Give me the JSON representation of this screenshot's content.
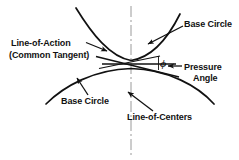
{
  "figure": {
    "background_color": "#ffffff",
    "ink_color": "#111111",
    "centerline_color": "#9a9a9a",
    "width": 239,
    "height": 160
  },
  "labels": {
    "line_of_action": "Line-of-Action",
    "common_tangent": "(Common Tangent)",
    "base_circle_upper": "Base Circle",
    "base_circle_lower": "Base Circle",
    "line_of_centers": "Line-of-Centers",
    "pressure": "Pressure",
    "angle": "Angle",
    "phi_symbol": "ϕ"
  },
  "geometry": {
    "pitch_point": {
      "x": 131,
      "y": 64
    },
    "line_of_centers": {
      "type": "dash-dot-vertical",
      "x": 131,
      "y_top": 6,
      "y_bottom": 155
    },
    "horizontal_reference": {
      "x_start": 102,
      "x_end": 175,
      "y": 64
    },
    "line_of_action": {
      "x_start": 96,
      "y_start": 56,
      "x_end": 178,
      "y_end": 76,
      "description": "common tangent to both base circles, inclined by the pressure angle"
    },
    "upper_base_circle_arc": {
      "description": "concave-up arc tangent to line-of-action, above pitch point",
      "x_start": 76,
      "y_start": 8,
      "x_end": 180,
      "y_end": 14,
      "apex_x": 131,
      "apex_y": 61
    },
    "lower_base_circle_arc": {
      "description": "concave-down arc tangent to line-of-action, below pitch point",
      "x_start": 46,
      "y_start": 104,
      "x_end": 214,
      "y_end": 104,
      "apex_x": 131,
      "apex_y": 68
    },
    "pressure_angle_value_marked": true
  },
  "leaders": [
    {
      "name": "leader-line-of-action",
      "from": {
        "x": 86,
        "y": 43
      },
      "to": {
        "x": 108,
        "y": 51
      },
      "arrowhead": "end"
    },
    {
      "name": "leader-base-circle-upper",
      "from": {
        "x": 182,
        "y": 26
      },
      "to": {
        "x": 147,
        "y": 44
      },
      "arrowhead": "end"
    },
    {
      "name": "leader-base-circle-lower",
      "from": {
        "x": 87,
        "y": 94
      },
      "to": {
        "x": 77,
        "y": 78
      },
      "arrowhead": "end"
    },
    {
      "name": "leader-line-of-centers",
      "from": {
        "x": 152,
        "y": 110
      },
      "to": {
        "x": 128,
        "y": 92
      },
      "arrowhead": "end"
    },
    {
      "name": "leader-pressure-angle",
      "from": {
        "x": 182,
        "y": 66
      },
      "to": {
        "x": 167,
        "y": 66
      },
      "arrowhead": "end"
    }
  ]
}
